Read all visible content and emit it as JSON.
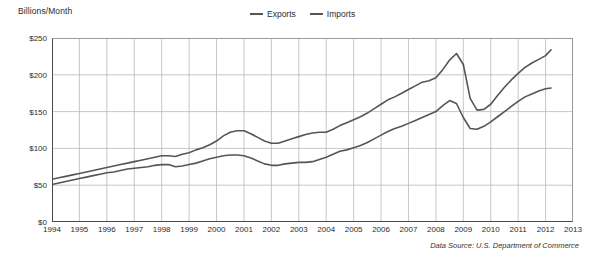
{
  "axis_title": "Billions/Month",
  "source_note": "Data Source: U.S. Department of Commerce",
  "legend": {
    "position": "top-center",
    "items": [
      {
        "label": "Exports",
        "color": "#555555"
      },
      {
        "label": "Imports",
        "color": "#555555"
      }
    ]
  },
  "chart_data": {
    "type": "line",
    "title": "",
    "subtitle": "",
    "xlabel": "",
    "ylabel": "Billions/Month",
    "xlim": [
      1994,
      2013
    ],
    "ylim": [
      0,
      250
    ],
    "grid": true,
    "legend_position": "top-center",
    "y_tick_labels": [
      "$250",
      "$200",
      "$150",
      "$100",
      "$50",
      "$0"
    ],
    "y_ticks": [
      250,
      200,
      150,
      100,
      50,
      0
    ],
    "x_tick_labels": [
      "1994",
      "1995",
      "1996",
      "1997",
      "1998",
      "1999",
      "2000",
      "2001",
      "2002",
      "2003",
      "2004",
      "2005",
      "2006",
      "2007",
      "2008",
      "2009",
      "2010",
      "2011",
      "2012",
      "2013"
    ],
    "x_ticks": [
      1994,
      1995,
      1996,
      1997,
      1998,
      1999,
      2000,
      2001,
      2002,
      2003,
      2004,
      2005,
      2006,
      2007,
      2008,
      2009,
      2010,
      2011,
      2012,
      2013
    ],
    "annotations": [
      "Data Source: U.S. Department of Commerce"
    ],
    "x": [
      1994.0,
      1994.25,
      1994.5,
      1994.75,
      1995.0,
      1995.25,
      1995.5,
      1995.75,
      1996.0,
      1996.25,
      1996.5,
      1996.75,
      1997.0,
      1997.25,
      1997.5,
      1997.75,
      1998.0,
      1998.25,
      1998.5,
      1998.75,
      1999.0,
      1999.25,
      1999.5,
      1999.75,
      2000.0,
      2000.25,
      2000.5,
      2000.75,
      2001.0,
      2001.25,
      2001.5,
      2001.75,
      2002.0,
      2002.25,
      2002.5,
      2002.75,
      2003.0,
      2003.25,
      2003.5,
      2003.75,
      2004.0,
      2004.25,
      2004.5,
      2004.75,
      2005.0,
      2005.25,
      2005.5,
      2005.75,
      2006.0,
      2006.25,
      2006.5,
      2006.75,
      2007.0,
      2007.25,
      2007.5,
      2007.75,
      2008.0,
      2008.25,
      2008.5,
      2008.75,
      2009.0,
      2009.25,
      2009.5,
      2009.75,
      2010.0,
      2010.25,
      2010.5,
      2010.75,
      2011.0,
      2011.25,
      2011.5,
      2011.75,
      2012.0,
      2012.2
    ],
    "series": [
      {
        "name": "Imports",
        "color": "#555555",
        "values": [
          58,
          60,
          62,
          64,
          66,
          68,
          70,
          72,
          74,
          76,
          78,
          80,
          82,
          84,
          86,
          88,
          90,
          90,
          89,
          92,
          94,
          98,
          101,
          105,
          110,
          117,
          122,
          124,
          124,
          120,
          115,
          110,
          107,
          107,
          110,
          113,
          116,
          119,
          121,
          122,
          122,
          126,
          131,
          135,
          139,
          143,
          148,
          154,
          160,
          166,
          170,
          175,
          180,
          185,
          190,
          192,
          196,
          207,
          220,
          229,
          214,
          168,
          152,
          153,
          160,
          172,
          183,
          193,
          202,
          210,
          216,
          221,
          226,
          234
        ]
      },
      {
        "name": "Exports",
        "color": "#555555",
        "values": [
          51,
          53,
          55,
          57,
          59,
          61,
          63,
          65,
          67,
          68,
          70,
          72,
          73,
          74,
          75,
          77,
          78,
          78,
          75,
          76,
          78,
          80,
          83,
          86,
          88,
          90,
          91,
          91,
          90,
          87,
          83,
          79,
          77,
          77,
          79,
          80,
          81,
          81,
          82,
          85,
          88,
          92,
          96,
          98,
          101,
          104,
          108,
          113,
          118,
          123,
          127,
          130,
          134,
          138,
          142,
          146,
          150,
          158,
          165,
          161,
          142,
          127,
          126,
          130,
          136,
          143,
          150,
          157,
          164,
          170,
          174,
          178,
          181,
          182
        ]
      }
    ]
  }
}
